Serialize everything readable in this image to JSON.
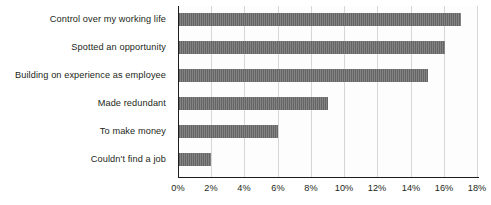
{
  "chart_data": {
    "type": "bar",
    "orientation": "horizontal",
    "title": "",
    "subtitle": "",
    "xlabel": "",
    "ylabel": "",
    "categories": [
      "Control over my working life",
      "Spotted an opportunity",
      "Building on experience as employee",
      "Made redundant",
      "To make money",
      "Couldn't find a job"
    ],
    "values": [
      17,
      16,
      15,
      9,
      6,
      2
    ],
    "value_suffix": "%",
    "xlim": [
      0,
      18
    ],
    "xticks": [
      0,
      2,
      4,
      6,
      8,
      10,
      12,
      14,
      16,
      18
    ],
    "xtick_labels": [
      "0%",
      "2%",
      "4%",
      "6%",
      "8%",
      "10%",
      "12%",
      "14%",
      "16%",
      "18%"
    ],
    "grid": "vertical",
    "legend": "none",
    "colors": {
      "bar_fill": "#6b6b6b",
      "gridline": "#d6d6d6",
      "axis_line": "#1c1c1c",
      "text": "#231f20",
      "plot_background": "#fdfdfd",
      "page_background": "#ffffff"
    }
  }
}
